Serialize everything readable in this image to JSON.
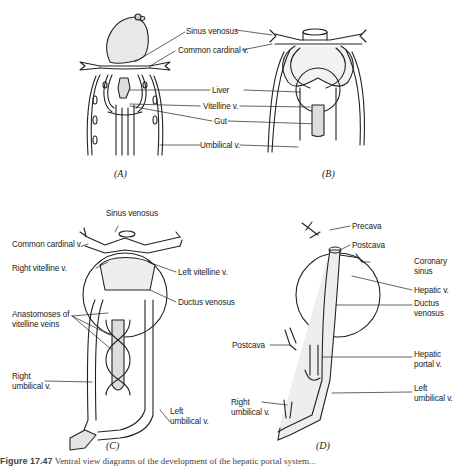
{
  "panels": {
    "A": {
      "label": "(A)",
      "annotations": [
        "Sinus venosus",
        "Common cardinal v.",
        "Liver",
        "Vitelline v.",
        "Gut",
        "Umbilical v."
      ]
    },
    "B": {
      "label": "(B)"
    },
    "C": {
      "label": "(C)",
      "annotations": {
        "sinus_venosus": "Sinus venosus",
        "common_cardinal": "Common cardinal v.",
        "right_vitelline": "Right vitelline v.",
        "left_vitelline": "Left vitelline v.",
        "ductus_venosus": "Ductus venosus",
        "anastomoses_1": "Anastomoses of",
        "anastomoses_2": "vitelline veins",
        "right_umbilical_1": "Right",
        "right_umbilical_2": "umbilical v.",
        "left_umbilical_1": "Left",
        "left_umbilical_2": "umbilical v."
      }
    },
    "D": {
      "label": "(D)",
      "annotations": {
        "precava": "Precava",
        "postcava_top": "Postcava",
        "coronary_1": "Coronary",
        "coronary_2": "sinus",
        "hepatic_v": "Hepatic v.",
        "ductus_1": "Ductus",
        "ductus_2": "venosus",
        "postcava_left": "Postcava",
        "hepatic_portal_1": "Hepatic",
        "hepatic_portal_2": "portal v.",
        "left_umbilical_1": "Left",
        "left_umbilical_2": "umbilical v.",
        "right_umbilical_1": "Right",
        "right_umbilical_2": "umbilical v."
      }
    }
  },
  "caption": {
    "number": "Figure 17.47",
    "text": "Ventral view diagrams of the development of the hepatic portal system..."
  }
}
